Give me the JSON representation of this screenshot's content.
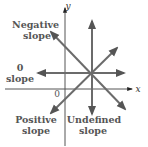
{
  "diagram": {
    "type": "slope-illustration",
    "axes": {
      "x_label": "x",
      "y_label": "y",
      "origin_label": "0"
    },
    "lines": [
      {
        "id": "negative",
        "label_line1": "Negative",
        "label_line2": "slope"
      },
      {
        "id": "zero",
        "label_line1": "0",
        "label_line2": "slope"
      },
      {
        "id": "positive",
        "label_line1": "Positive",
        "label_line2": "slope"
      },
      {
        "id": "undefined",
        "label_line1": "Undefined",
        "label_line2": "slope"
      }
    ],
    "colors": {
      "line": "#6b6b6b",
      "axis": "#555555",
      "text": "#555555",
      "background": "#ffffff"
    }
  }
}
